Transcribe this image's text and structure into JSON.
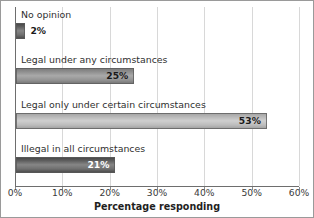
{
  "chart_data": {
    "type": "bar",
    "orientation": "horizontal",
    "title": "",
    "xlabel": "Percentage responding",
    "ylabel": "",
    "xlim": [
      0,
      60
    ],
    "grid": true,
    "legend": false,
    "categories": [
      "No opinion",
      "Legal under any circumstances",
      "Legal only under certain circumstances",
      "Illegal in all circumstances"
    ],
    "values": [
      2,
      25,
      53,
      21
    ],
    "value_labels": [
      "2%",
      "25%",
      "53%",
      "21%"
    ],
    "bar_tones": [
      "tone-dark",
      "tone-mid",
      "tone-light",
      "tone-dark"
    ],
    "label_placement": [
      "outside",
      "inside",
      "inside",
      "inside-light"
    ],
    "xticks": [
      0,
      10,
      20,
      30,
      40,
      50,
      60
    ],
    "xtick_labels": [
      "0%",
      "10%",
      "20%",
      "30%",
      "40%",
      "50%",
      "60%"
    ]
  },
  "colors": {
    "background": "#ffffff",
    "border": "#9a9a9a",
    "axis": "#6e6e6e",
    "gridline": "#d8d8d8",
    "bar_dark": "#5d5d5d",
    "bar_mid": "#8d8d8d",
    "bar_light": "#b6b6b6",
    "label_text": "#2f2f2f"
  }
}
